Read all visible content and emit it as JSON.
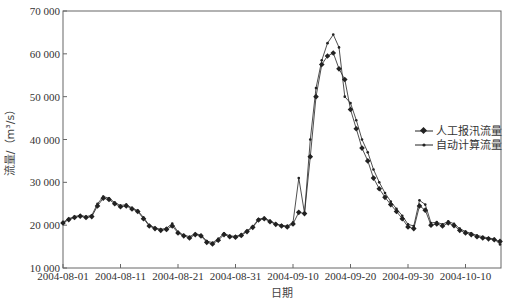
{
  "chart_data": {
    "type": "line",
    "title": "",
    "xlabel": "日期",
    "ylabel": "流量/（m³/s）",
    "ylim": [
      10000,
      70000
    ],
    "yticks": [
      10000,
      20000,
      30000,
      40000,
      50000,
      60000,
      70000
    ],
    "ytick_labels": [
      "10 000",
      "20 000",
      "30 000",
      "40 000",
      "50 000",
      "60 000",
      "70 000"
    ],
    "xticks": [
      "2004-08-01",
      "2004-08-11",
      "2004-08-21",
      "2004-08-31",
      "2004-09-10",
      "2004-09-20",
      "2004-09-30",
      "2004-10-10"
    ],
    "x_start": "2004-08-01",
    "x_end": "2004-10-16",
    "grid": false,
    "legend_position": "right-center",
    "series": [
      {
        "name": "人工报汛流量",
        "marker": "diamond-large",
        "values": [
          20500,
          21300,
          21800,
          22100,
          21800,
          22000,
          24500,
          26300,
          26000,
          25000,
          24300,
          24500,
          23800,
          23200,
          21500,
          19800,
          19200,
          18800,
          19000,
          19800,
          18200,
          17500,
          17000,
          17800,
          17500,
          16000,
          15600,
          16500,
          17800,
          17300,
          17200,
          17600,
          18500,
          19500,
          21200,
          21500,
          20800,
          20200,
          19800,
          19600,
          20300,
          23000,
          22700,
          36000,
          50000,
          57500,
          59500,
          60200,
          56500,
          54000,
          47000,
          42500,
          38000,
          35000,
          31000,
          28500,
          26500,
          24800,
          23200,
          21500,
          19600,
          19200,
          24500,
          23500,
          20000,
          20300,
          19800,
          20500,
          19900,
          18800,
          18200,
          17800,
          17300,
          17000,
          16800,
          16600,
          16200
        ]
      },
      {
        "name": "自动计算流量",
        "marker": "dot-small",
        "values": [
          20700,
          21500,
          22000,
          22300,
          22000,
          22300,
          25000,
          26700,
          26300,
          25300,
          24600,
          24800,
          24000,
          23400,
          21800,
          20000,
          19400,
          19000,
          19300,
          20400,
          18400,
          17700,
          17300,
          18000,
          17700,
          16300,
          15900,
          16800,
          18100,
          17500,
          17400,
          17800,
          18700,
          19700,
          21400,
          21700,
          21000,
          20300,
          20000,
          19800,
          20600,
          31000,
          22800,
          40000,
          52000,
          58500,
          62500,
          64500,
          61500,
          50000,
          48500,
          44500,
          40000,
          37000,
          33000,
          30000,
          27500,
          25500,
          23800,
          22200,
          20200,
          19800,
          25800,
          24800,
          20500,
          20700,
          20200,
          20900,
          20300,
          19200,
          18500,
          18100,
          17600,
          17300,
          17000,
          16800,
          15500
        ]
      }
    ]
  },
  "legend": {
    "items": [
      {
        "label": "人工报汛流量"
      },
      {
        "label": "自动计算流量"
      }
    ]
  },
  "axes": {
    "x_title": "日期",
    "y_title": "流量/（m³/s）"
  },
  "colors": {
    "line": "#222222",
    "axis": "#555555"
  }
}
